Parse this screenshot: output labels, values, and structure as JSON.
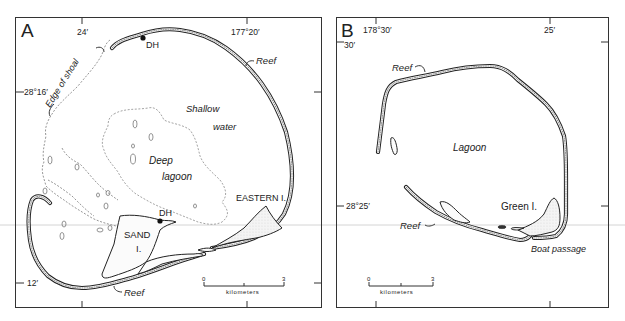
{
  "figure": {
    "panels": [
      {
        "id": "A",
        "letter": "A",
        "coords": {
          "top_left": "24′",
          "top_right": "177°20′",
          "left_upper": "28°16′",
          "left_lower": "12′"
        },
        "labels": {
          "edge_of_shoal": "Edge of shoal",
          "shallow_water_1": "Shallow",
          "shallow_water_2": "water",
          "deep_lagoon_1": "Deep",
          "deep_lagoon_2": "lagoon",
          "reef_top": "Reef",
          "reef_bottom": "Reef",
          "eastern_island": "EASTERN I.",
          "sand_island_1": "SAND",
          "sand_island_2": "I.",
          "dh_top": "DH",
          "dh_sand": "DH"
        },
        "scale_bar": {
          "start": "0",
          "end": "3",
          "unit": "kilometers"
        }
      },
      {
        "id": "B",
        "letter": "B",
        "coords": {
          "top_left": "178°30′",
          "top_right": "25′",
          "left_upper": "30′",
          "left_lower": "28°25′"
        },
        "labels": {
          "reef_top": "Reef",
          "reef_bottom": "Reef",
          "lagoon": "Lagoon",
          "green_island": "Green I.",
          "boat_passage": "Boat passage"
        },
        "scale_bar": {
          "start": "0",
          "end": "3",
          "unit": "kilometers"
        }
      }
    ],
    "colors": {
      "ink": "#222222",
      "background": "#ffffff",
      "dashed_contour": "#8a8a8a"
    }
  }
}
